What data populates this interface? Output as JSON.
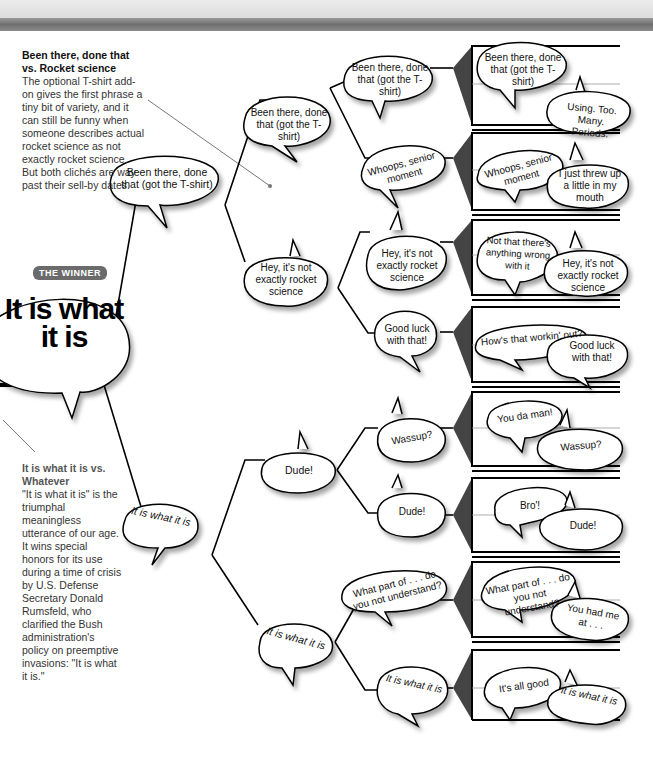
{
  "notes": {
    "top": {
      "title": "Been there, done that vs. Rocket science",
      "body": "The optional T-shirt add-on gives the first phrase a tiny bit of variety, and it can still be funny when someone describes actual rocket science as not exactly rocket science. But both clichés are way past their sell-by dates."
    },
    "bottom": {
      "title": "It is what it is vs. Whatever",
      "body": "\"It is what it is\" is the triumphal meaningless utterance of our age. It wins special honors for its use during a time of crisis by U.S. Defense Secretary Donald Rumsfeld, who clarified the Bush administration's policy on preemptive invasions: \"It is what it is.\""
    }
  },
  "winner": {
    "badge": "THE WINNER",
    "phrase": "It is what it is"
  },
  "bracket": {
    "round3": [
      {
        "label": "Been there, done that (got the T-shirt)"
      },
      {
        "label": "It is what it is"
      }
    ],
    "round2": [
      {
        "label": "Been there, done that (got the T-shirt)"
      },
      {
        "label": "Hey, it's not exactly rocket science"
      },
      {
        "label": "Dude!"
      },
      {
        "label": "It is what it is"
      }
    ],
    "round1": [
      {
        "label": "Been there, done that (got the T-shirt)"
      },
      {
        "label": "Whoops, senior moment"
      },
      {
        "label": "Hey, it's not exactly rocket science"
      },
      {
        "label": "Good luck with that!"
      },
      {
        "label": "Wassup?"
      },
      {
        "label": "Dude!"
      },
      {
        "label": "What part of . . . do you not understand?"
      },
      {
        "label": "It is what it is"
      }
    ],
    "matchups": [
      {
        "a": "Been there, done that (got the T-shirt)",
        "b": "Using. Too. Many. Periods."
      },
      {
        "a": "Whoops, senior moment",
        "b": "I just threw up a little in my mouth"
      },
      {
        "a": "Not that there's anything wrong with it",
        "b": "Hey, it's not exactly rocket science"
      },
      {
        "a": "How's that workin' out?",
        "b": "Good luck with that!"
      },
      {
        "a": "You da man!",
        "b": "Wassup?"
      },
      {
        "a": "Bro'!",
        "b": "Dude!"
      },
      {
        "a": "What part of . . . do you not understand?",
        "b": "You had me at . . ."
      },
      {
        "a": "It's all good",
        "b": "It is what it is"
      }
    ]
  }
}
